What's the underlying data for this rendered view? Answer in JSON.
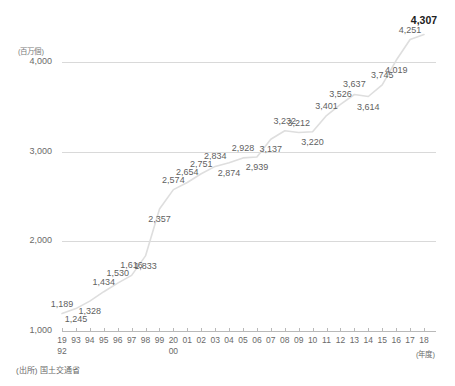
{
  "axes": {
    "y_unit": "(百万個)",
    "y_ticks": [
      "4,000",
      "3,000",
      "2,000",
      "1,000"
    ],
    "x_unit": "(年度)",
    "x_ticks": [
      {
        "top": "19",
        "bottom": "92"
      },
      {
        "top": "93",
        "bottom": ""
      },
      {
        "top": "94",
        "bottom": ""
      },
      {
        "top": "95",
        "bottom": ""
      },
      {
        "top": "96",
        "bottom": ""
      },
      {
        "top": "97",
        "bottom": ""
      },
      {
        "top": "98",
        "bottom": ""
      },
      {
        "top": "99",
        "bottom": ""
      },
      {
        "top": "20",
        "bottom": "00"
      },
      {
        "top": "01",
        "bottom": ""
      },
      {
        "top": "02",
        "bottom": ""
      },
      {
        "top": "03",
        "bottom": ""
      },
      {
        "top": "04",
        "bottom": ""
      },
      {
        "top": "05",
        "bottom": ""
      },
      {
        "top": "06",
        "bottom": ""
      },
      {
        "top": "07",
        "bottom": ""
      },
      {
        "top": "08",
        "bottom": ""
      },
      {
        "top": "09",
        "bottom": ""
      },
      {
        "top": "10",
        "bottom": ""
      },
      {
        "top": "11",
        "bottom": ""
      },
      {
        "top": "12",
        "bottom": ""
      },
      {
        "top": "13",
        "bottom": ""
      },
      {
        "top": "14",
        "bottom": ""
      },
      {
        "top": "15",
        "bottom": ""
      },
      {
        "top": "16",
        "bottom": ""
      },
      {
        "top": "17",
        "bottom": ""
      },
      {
        "top": "18",
        "bottom": ""
      }
    ]
  },
  "footer": {
    "source": "(出所) 国土交通省"
  },
  "chart_data": {
    "type": "line",
    "title": "",
    "subtitle": "",
    "xlabel": "(年度)",
    "ylabel": "(百万個)",
    "ylim": [
      1000,
      4400
    ],
    "grid": true,
    "legend": false,
    "categories": [
      "1992",
      "1993",
      "1994",
      "1995",
      "1996",
      "1997",
      "1998",
      "1999",
      "2000",
      "2001",
      "2002",
      "2003",
      "2004",
      "2005",
      "2006",
      "2007",
      "2008",
      "2009",
      "2010",
      "2011",
      "2012",
      "2013",
      "2014",
      "2015",
      "2016",
      "2017",
      "2018"
    ],
    "values": [
      1189,
      1245,
      1328,
      1434,
      1530,
      1616,
      1833,
      2357,
      2574,
      2654,
      2751,
      2834,
      2874,
      2928,
      2939,
      3137,
      3232,
      3212,
      3220,
      3401,
      3526,
      3637,
      3614,
      3745,
      4019,
      4251,
      4307
    ],
    "point_labels": [
      "1,189",
      "1,245",
      "1,328",
      "1,434",
      "1,530",
      "1,616",
      "1,833",
      "2,357",
      "2,574",
      "2,654",
      "2,751",
      "2,834",
      "2,874",
      "2,928",
      "2,939",
      "3,137",
      "3,232",
      "3,212",
      "3,220",
      "3,401",
      "3,526",
      "3,637",
      "3,614",
      "3,745",
      "4,019",
      "4,251",
      "4,307"
    ],
    "label_positions": [
      "above",
      "below",
      "below",
      "above",
      "above",
      "above",
      "below",
      "below",
      "above",
      "above",
      "above",
      "above",
      "below",
      "above",
      "below",
      "below",
      "above",
      "above",
      "below",
      "above",
      "above",
      "above",
      "below",
      "above",
      "below",
      "above",
      "above"
    ],
    "highlight_index": 26,
    "line_color": "#dedede",
    "grid_color": "#d9d9d9",
    "axis_color": "#b9b9b9"
  }
}
